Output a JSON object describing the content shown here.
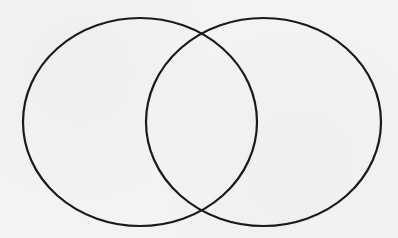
{
  "diagram": {
    "type": "venn",
    "background_color": "#f3f3f1",
    "stroke_color": "#1a1a1a",
    "stroke_width": 2.2,
    "sets": [
      {
        "name": "left-set",
        "label": "",
        "cx": 140,
        "cy": 122,
        "rx": 117,
        "ry": 104
      },
      {
        "name": "right-set",
        "label": "",
        "cx": 263.5,
        "cy": 122,
        "rx": 117.5,
        "ry": 104
      }
    ],
    "intersection_points": [
      {
        "x": 201,
        "y": 34
      },
      {
        "x": 201,
        "y": 209
      }
    ]
  }
}
